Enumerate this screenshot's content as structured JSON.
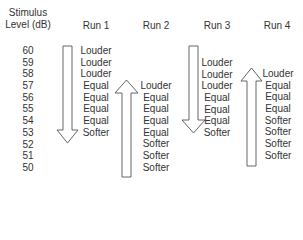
{
  "header": {
    "level_line1": "Stimulus",
    "level_line2": "Level (dB)",
    "runs": [
      "Run 1",
      "Run 2",
      "Run 3",
      "Run 4"
    ]
  },
  "levels": [
    "60",
    "59",
    "58",
    "57",
    "56",
    "55",
    "54",
    "53",
    "52",
    "51",
    "50"
  ],
  "runs": [
    {
      "name": "Run 1",
      "direction": "descending",
      "start_level": "60",
      "responses": [
        "Louder",
        "Louder",
        "Louder",
        "Equal",
        "Equal",
        "Equal",
        "Equal",
        "Softer"
      ]
    },
    {
      "name": "Run 2",
      "direction": "ascending",
      "start_level": "57",
      "responses": [
        "Louder",
        "Equal",
        "Equal",
        "Equal",
        "Equal",
        "Softer",
        "Softer",
        "Softer"
      ]
    },
    {
      "name": "Run 3",
      "direction": "descending",
      "start_level": "59",
      "responses": [
        "Louder",
        "Louder",
        "Louder",
        "Equal",
        "Equal",
        "Equal",
        "Softer"
      ]
    },
    {
      "name": "Run 4",
      "direction": "ascending",
      "start_level": "58",
      "responses": [
        "Louder",
        "Equal",
        "Equal",
        "Equal",
        "Softer",
        "Softer",
        "Softer",
        "Softer"
      ]
    }
  ]
}
